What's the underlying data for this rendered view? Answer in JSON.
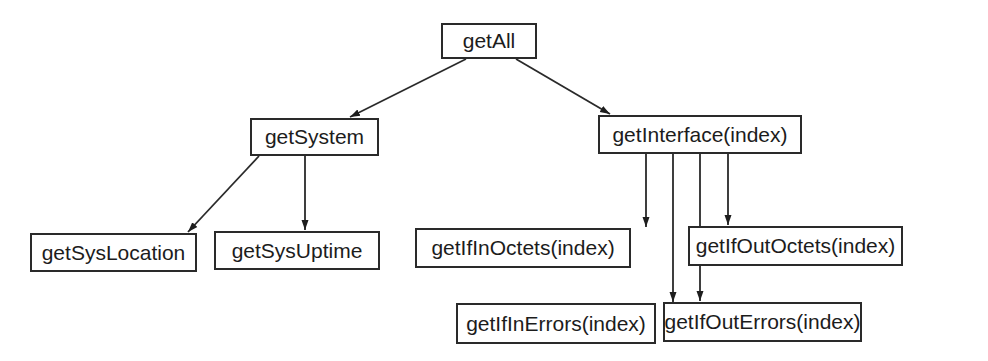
{
  "diagram": {
    "type": "call-tree",
    "nodes": [
      {
        "id": "getAll",
        "label": "getAll",
        "x": 441,
        "y": 23,
        "w": 96,
        "h": 36
      },
      {
        "id": "getSystem",
        "label": "getSystem",
        "x": 250,
        "y": 118,
        "w": 129,
        "h": 38
      },
      {
        "id": "getInterface",
        "label": "getInterface(index)",
        "x": 598,
        "y": 115,
        "w": 204,
        "h": 39
      },
      {
        "id": "getSysLocation",
        "label": "getSysLocation",
        "x": 30,
        "y": 233,
        "w": 167,
        "h": 39
      },
      {
        "id": "getSysUptime",
        "label": "getSysUptime",
        "x": 214,
        "y": 231,
        "w": 166,
        "h": 39
      },
      {
        "id": "getIfInOctets",
        "label": "getIfInOctets(index)",
        "x": 415,
        "y": 228,
        "w": 216,
        "h": 40
      },
      {
        "id": "getIfOutOctets",
        "label": "getIfOutOctets(index)",
        "x": 688,
        "y": 226,
        "w": 215,
        "h": 40
      },
      {
        "id": "getIfInErrors",
        "label": "getIfInErrors(index)",
        "x": 456,
        "y": 303,
        "w": 200,
        "h": 41
      },
      {
        "id": "getIfOutErrors",
        "label": "getIfOutErrors(index)",
        "x": 663,
        "y": 302,
        "w": 199,
        "h": 40
      }
    ],
    "edges": [
      {
        "from": "getAll",
        "to": "getSystem",
        "x1": 466,
        "y1": 59,
        "x2": 350,
        "y2": 117
      },
      {
        "from": "getAll",
        "to": "getInterface",
        "x1": 516,
        "y1": 59,
        "x2": 610,
        "y2": 114
      },
      {
        "from": "getSystem",
        "to": "getSysLocation",
        "x1": 259,
        "y1": 156,
        "x2": 188,
        "y2": 232
      },
      {
        "from": "getSystem",
        "to": "getSysUptime",
        "x1": 305,
        "y1": 156,
        "x2": 305,
        "y2": 230
      },
      {
        "from": "getInterface",
        "to": "getIfInOctets",
        "x1": 646,
        "y1": 154,
        "x2": 646,
        "y2": 227
      },
      {
        "from": "getInterface",
        "to": "getIfInErrors",
        "x1": 673,
        "y1": 154,
        "x2": 673,
        "y2": 302
      },
      {
        "from": "getInterface",
        "to": "getIfOutErrors",
        "x1": 700,
        "y1": 154,
        "x2": 700,
        "y2": 301
      },
      {
        "from": "getInterface",
        "to": "getIfOutOctets",
        "x1": 728,
        "y1": 154,
        "x2": 728,
        "y2": 225
      }
    ],
    "colors": {
      "stroke": "#2a2a2a",
      "text": "#1c1c1c",
      "background": "#ffffff"
    }
  }
}
